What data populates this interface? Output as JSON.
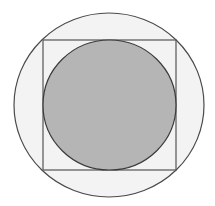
{
  "diagram": {
    "outer_circle": {
      "cx": 109,
      "cy": 105,
      "rx": 95,
      "ry": 92,
      "fill": "#f3f3f3",
      "stroke": "#4a4a4a"
    },
    "square": {
      "x": 43,
      "y": 40,
      "width": 133,
      "height": 130,
      "fill": "#f3f3f3",
      "stroke": "#555555"
    },
    "inner_circle": {
      "cx": 109.5,
      "cy": 105,
      "rx": 66.5,
      "ry": 65,
      "fill": "#b5b5b5",
      "stroke": "#3a3a3a"
    }
  }
}
